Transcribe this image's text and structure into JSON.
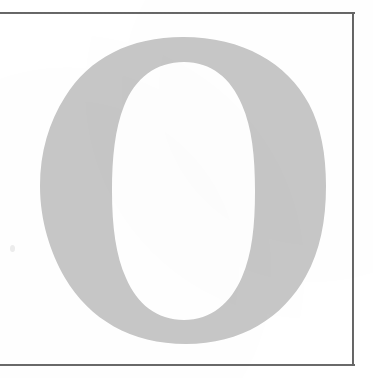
{
  "document": {
    "kind": "scanned-page",
    "page_background_color": "#ffffff",
    "rule_color": "#4a4a4a"
  },
  "frame": {
    "name": "rectangular-rule-border",
    "top_rule_y": 12,
    "bottom_rule_y": 364,
    "right_rule_x": 352,
    "left_rule_visible": false,
    "stroke_width_px": 2
  },
  "glyph": {
    "character": "O",
    "description": "large serif capital letter O",
    "fill_color": "#c7c7c7",
    "counter_color": "#ffffff",
    "outer_bounds": {
      "left": 40,
      "top": 37,
      "right": 326,
      "bottom": 344
    },
    "counter_bounds": {
      "left": 112,
      "top": 62,
      "right": 255,
      "bottom": 320
    }
  },
  "artifacts": {
    "speck_label": "scanner speck",
    "speck_color": "#ededed"
  }
}
